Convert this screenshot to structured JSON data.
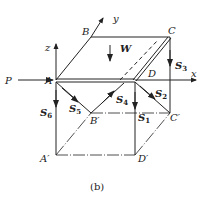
{
  "figure": {
    "caption": "(b)",
    "points": {
      "A": "A",
      "B": "B",
      "C": "C",
      "D": "D",
      "A_prime": "A′",
      "B_prime": "B′",
      "C_prime": "C′",
      "D_prime": "D′"
    },
    "axes": {
      "x": "x",
      "y": "y",
      "z": "z"
    },
    "forces": {
      "P": "P",
      "W": "W",
      "S1": {
        "base": "S",
        "sub": "1"
      },
      "S2": {
        "base": "S",
        "sub": "2"
      },
      "S3": {
        "base": "S",
        "sub": "3"
      },
      "S4": {
        "base": "S",
        "sub": "4"
      },
      "S5": {
        "base": "S",
        "sub": "5"
      },
      "S6": {
        "base": "S",
        "sub": "6"
      }
    },
    "colors": {
      "line": "#222222",
      "background": "#ffffff"
    }
  }
}
